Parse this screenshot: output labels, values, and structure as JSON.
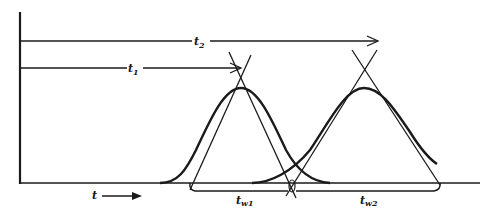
{
  "figure": {
    "colors": {
      "ink": "#1a1a1a",
      "background": "#ffffff"
    }
  },
  "labels": {
    "t2": {
      "main": "t",
      "sub": "2"
    },
    "t1": {
      "main": "t",
      "sub": "1"
    },
    "time_axis": {
      "main": "t",
      "arrow": "⟶"
    },
    "tw1": {
      "main": "t",
      "sub": "w1"
    },
    "tw2": {
      "main": "t",
      "sub": "w2"
    }
  },
  "peaks": [
    {
      "name": "peak-1",
      "retention_label": "t1",
      "width_label": "tw1"
    },
    {
      "name": "peak-2",
      "retention_label": "t2",
      "width_label": "tw2"
    }
  ]
}
